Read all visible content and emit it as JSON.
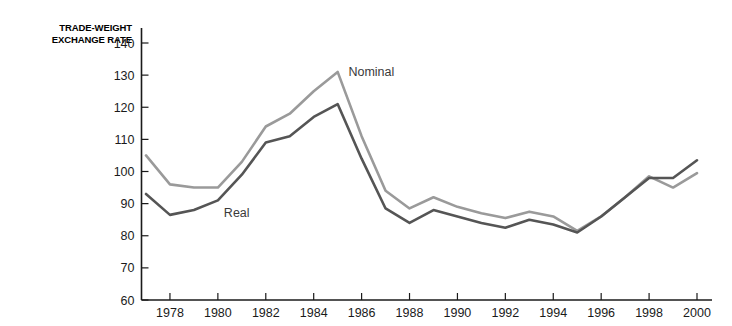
{
  "chart_data": {
    "type": "line",
    "title": "",
    "ylabel": "TRADE-WEIGHT EXCHANGE RATE",
    "xlabel": "",
    "ylim": [
      60,
      140
    ],
    "xlim": [
      1977,
      2000
    ],
    "yticks": [
      60,
      70,
      80,
      90,
      100,
      110,
      120,
      130,
      140
    ],
    "xticks": [
      1978,
      1980,
      1982,
      1984,
      1986,
      1988,
      1990,
      1992,
      1994,
      1996,
      1998,
      2000
    ],
    "grid": false,
    "legend_position": "inline-annotation",
    "x": [
      1977,
      1978,
      1979,
      1980,
      1981,
      1982,
      1983,
      1984,
      1985,
      1986,
      1987,
      1988,
      1989,
      1990,
      1991,
      1992,
      1993,
      1994,
      1995,
      1996,
      1997,
      1998,
      1999,
      2000
    ],
    "series": [
      {
        "name": "Nominal",
        "color": "#9a9a9a",
        "values": [
          105,
          96,
          95,
          95,
          103,
          114,
          118,
          125,
          131,
          111,
          94,
          88.5,
          92,
          89,
          87,
          85.5,
          87.5,
          86,
          81.5,
          86,
          92,
          98.5,
          95,
          99.5
        ]
      },
      {
        "name": "Real",
        "color": "#555555",
        "values": [
          93,
          86.5,
          88,
          91,
          99,
          109,
          111,
          117,
          121,
          104,
          88.5,
          84,
          88,
          86,
          84,
          82.5,
          85,
          83.5,
          81,
          86,
          92,
          98,
          98,
          103.5
        ]
      }
    ],
    "annotations": [
      {
        "text": "Nominal",
        "x": 1985.2,
        "y": 131
      },
      {
        "text": "Real",
        "x": 1980.0,
        "y": 87
      }
    ]
  },
  "axis_title": {
    "line1": "TRADE-WEIGHT",
    "line2": "EXCHANGE RATE"
  }
}
